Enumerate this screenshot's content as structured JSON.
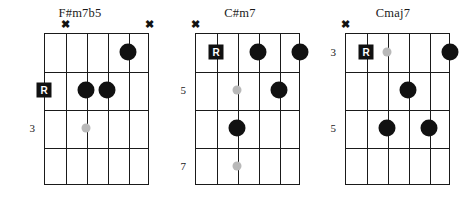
{
  "page": {
    "type": "guitar-chord-diagram-sheet",
    "chord_count": 3
  },
  "symbols": {
    "mute_marker": "✖",
    "root_marker": "R"
  },
  "diagrams": [
    {
      "id": "chord-f-sharp-m7b5",
      "title": "F#m7b5",
      "strings": 6,
      "frets": 4,
      "fret_labels": [
        {
          "text": "3",
          "fret_row": 3
        }
      ],
      "mutes": [
        {
          "string": 2
        },
        {
          "string": 6
        }
      ],
      "root_markers": [
        {
          "string": 1,
          "fret_row": 2,
          "label": "R",
          "outside": true
        }
      ],
      "dots": [
        {
          "string": 5,
          "fret_row": 1,
          "style": "filled"
        },
        {
          "string": 3,
          "fret_row": 2,
          "style": "filled"
        },
        {
          "string": 4,
          "fret_row": 2,
          "style": "filled"
        },
        {
          "string": 3,
          "fret_row": 3,
          "style": "optional"
        }
      ]
    },
    {
      "id": "chord-c-sharp-m7",
      "title": "C#m7",
      "strings": 6,
      "frets": 4,
      "fret_labels": [
        {
          "text": "5",
          "fret_row": 2
        },
        {
          "text": "7",
          "fret_row": 4
        }
      ],
      "mutes": [
        {
          "string": 1
        }
      ],
      "root_markers": [
        {
          "string": 2,
          "fret_row": 1,
          "label": "R",
          "outside": false
        }
      ],
      "dots": [
        {
          "string": 4,
          "fret_row": 1,
          "style": "filled"
        },
        {
          "string": 6,
          "fret_row": 1,
          "style": "filled"
        },
        {
          "string": 3,
          "fret_row": 2,
          "style": "optional"
        },
        {
          "string": 5,
          "fret_row": 2,
          "style": "filled"
        },
        {
          "string": 3,
          "fret_row": 3,
          "style": "filled"
        },
        {
          "string": 3,
          "fret_row": 4,
          "style": "optional"
        }
      ]
    },
    {
      "id": "chord-cmaj7",
      "title": "Cmaj7",
      "strings": 6,
      "frets": 4,
      "fret_labels": [
        {
          "text": "3",
          "fret_row": 1
        },
        {
          "text": "5",
          "fret_row": 3
        }
      ],
      "mutes": [
        {
          "string": 1
        }
      ],
      "root_markers": [
        {
          "string": 2,
          "fret_row": 1,
          "label": "R",
          "outside": false
        }
      ],
      "dots": [
        {
          "string": 3,
          "fret_row": 1,
          "style": "optional"
        },
        {
          "string": 6,
          "fret_row": 1,
          "style": "filled"
        },
        {
          "string": 4,
          "fret_row": 2,
          "style": "filled"
        },
        {
          "string": 3,
          "fret_row": 3,
          "style": "filled"
        },
        {
          "string": 5,
          "fret_row": 3,
          "style": "filled"
        }
      ]
    }
  ],
  "layout": {
    "panels": [
      {
        "left": 0,
        "board_left": 44,
        "board_top": 33,
        "board_width": 105,
        "board_height": 152
      },
      {
        "left": 160,
        "board_left": 195,
        "board_top": 33,
        "board_width": 105,
        "board_height": 152
      },
      {
        "left": 313,
        "board_left": 345,
        "board_top": 33,
        "board_width": 105,
        "board_height": 152
      }
    ]
  }
}
